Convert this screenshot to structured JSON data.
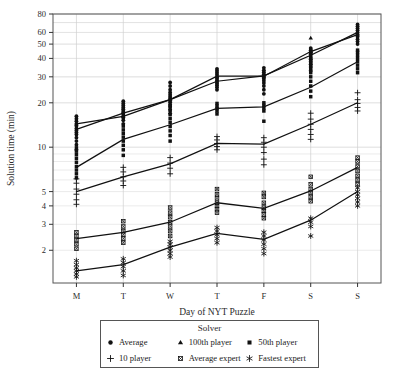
{
  "chart_data": {
    "type": "line",
    "title": "",
    "xlabel": "Day of NYT Puzzle",
    "ylabel": "Solution time (min)",
    "categories": [
      "M",
      "T",
      "W",
      "T",
      "F",
      "S",
      "S"
    ],
    "yscale": "log",
    "ylim": [
      1.2,
      80
    ],
    "yticks": [
      2,
      3,
      4,
      5,
      10,
      20,
      30,
      40,
      50,
      60,
      80
    ],
    "ytick_labels": [
      "2",
      "3",
      "4",
      "5",
      "10",
      "20",
      "30",
      "40",
      "50",
      "60",
      "80"
    ],
    "grid": true,
    "legend_position": "below",
    "legend_title": "Solver",
    "series": [
      {
        "name": "Average",
        "marker": "circle",
        "values": [
          13.2,
          17.0,
          21.0,
          28.0,
          30.5,
          42.0,
          60.0
        ],
        "scatter": [
          [
            9.6,
            10.4,
            11.0,
            11.6,
            12.2,
            12.6,
            13.0,
            13.4,
            13.9,
            14.4,
            15.0,
            15.6,
            16.2
          ],
          [
            14.4,
            15.2,
            15.8,
            16.3,
            16.8,
            17.2,
            17.6,
            18.1,
            18.6,
            19.2,
            19.8,
            20.5
          ],
          [
            17.0,
            18.0,
            18.8,
            19.5,
            20.2,
            20.8,
            21.4,
            22.0,
            22.7,
            23.5,
            24.5,
            26.0,
            27.5
          ],
          [
            24.5,
            25.5,
            26.3,
            27.0,
            27.7,
            28.4,
            29.2,
            30.0,
            31.0,
            32.0,
            33.0,
            34.0
          ],
          [
            23.0,
            24.5,
            26.0,
            27.2,
            28.2,
            29.2,
            30.2,
            31.2,
            32.2,
            33.2,
            34.5
          ],
          [
            33.0,
            35.0,
            36.5,
            38.0,
            39.5,
            41.0,
            42.5,
            44.0,
            45.5,
            47.0
          ],
          [
            50.0,
            52.0,
            54.0,
            56.0,
            58.0,
            60.0,
            62.0,
            64.0,
            66.0,
            68.0
          ]
        ]
      },
      {
        "name": "100th player",
        "marker": "triangle",
        "values": [
          14.4,
          16.2,
          21.0,
          30.3,
          30.3,
          44.5,
          58.0
        ],
        "scatter": [
          [
            14.4
          ],
          [
            16.2
          ],
          [
            21.0
          ],
          [
            30.3
          ],
          [
            30.3
          ],
          [
            44.5,
            55.0
          ],
          [
            58.0
          ]
        ]
      },
      {
        "name": "50th player",
        "marker": "square",
        "values": [
          7.3,
          11.3,
          14.2,
          18.3,
          18.8,
          25.5,
          38.0
        ],
        "scatter": [
          [
            6.2,
            6.6,
            7.0,
            7.4,
            7.9,
            8.4,
            8.9,
            9.4,
            9.9
          ],
          [
            8.8,
            9.6,
            10.3,
            11.0,
            11.7,
            12.4,
            13.1,
            13.9
          ],
          [
            11.0,
            12.0,
            12.9,
            13.8,
            14.7,
            15.6,
            16.6,
            17.8,
            19.0
          ],
          [
            16.8,
            17.6,
            18.3,
            19.0,
            19.8
          ],
          [
            15.0,
            17.6,
            18.4,
            19.2,
            20.0
          ],
          [
            22.0,
            24.0,
            26.0,
            28.0,
            30.0,
            32.0,
            34.0,
            36.0,
            38.0,
            40.0,
            43.0,
            45.5
          ],
          [
            32.0,
            34.0,
            36.0,
            38.0,
            40.0,
            42.0,
            44.0,
            45.5
          ]
        ]
      },
      {
        "name": "10 player",
        "marker": "plus",
        "values": [
          5.0,
          6.3,
          7.7,
          10.6,
          10.5,
          14.3,
          20.0
        ],
        "scatter": [
          [
            4.1,
            4.4,
            4.8,
            5.2,
            5.7,
            6.1
          ],
          [
            5.5,
            5.9,
            6.3,
            6.8,
            7.3
          ],
          [
            6.6,
            7.2,
            7.8,
            8.5
          ],
          [
            9.6,
            10.1,
            10.6,
            11.2,
            11.8
          ],
          [
            7.6,
            8.3,
            9.2,
            10.0,
            10.8,
            11.6
          ],
          [
            11.3,
            12.2,
            13.2,
            14.3,
            15.5,
            17.0
          ],
          [
            17.6,
            18.6,
            19.8,
            21.0,
            23.4
          ]
        ]
      },
      {
        "name": "Average expert",
        "marker": "crossed-square",
        "values": [
          2.4,
          2.65,
          3.1,
          4.2,
          3.85,
          5.05,
          7.3
        ],
        "scatter": [
          [
            2.05,
            2.2,
            2.35,
            2.5,
            2.65
          ],
          [
            2.25,
            2.4,
            2.55,
            2.7,
            2.9,
            3.15
          ],
          [
            2.5,
            2.7,
            2.9,
            3.1,
            3.35,
            3.6,
            3.9
          ],
          [
            3.6,
            3.8,
            4.0,
            4.2,
            4.5,
            4.8,
            5.2
          ],
          [
            3.3,
            3.5,
            3.7,
            3.9,
            4.2,
            4.6,
            4.9
          ],
          [
            4.3,
            4.6,
            4.9,
            5.2,
            5.6,
            6.3
          ],
          [
            5.6,
            6.0,
            6.4,
            6.9,
            7.4,
            8.0,
            8.5
          ]
        ]
      },
      {
        "name": "Fastest expert",
        "marker": "asterisk",
        "values": [
          1.45,
          1.6,
          2.1,
          2.6,
          2.37,
          3.2,
          5.0
        ],
        "scatter": [
          [
            1.32,
            1.38,
            1.45,
            1.52,
            1.6,
            1.7
          ],
          [
            1.35,
            1.45,
            1.55,
            1.65,
            1.75
          ],
          [
            1.8,
            1.9,
            2.0,
            2.1,
            2.2,
            2.3
          ],
          [
            2.25,
            2.4,
            2.55,
            2.7,
            2.85
          ],
          [
            1.9,
            2.05,
            2.2,
            2.35,
            2.5,
            2.65
          ],
          [
            2.5,
            2.9,
            3.1,
            3.3
          ],
          [
            4.0,
            4.25,
            4.5,
            4.75,
            5.0,
            5.3
          ]
        ]
      }
    ]
  },
  "legend": {
    "title": "Solver",
    "items": [
      {
        "label": "Average",
        "marker": "circle-icon"
      },
      {
        "label": "100th player",
        "marker": "triangle-icon"
      },
      {
        "label": "50th player",
        "marker": "square-icon"
      },
      {
        "label": "10 player",
        "marker": "plus-icon"
      },
      {
        "label": "Average expert",
        "marker": "crossed-square-icon"
      },
      {
        "label": "Fastest expert",
        "marker": "asterisk-icon"
      }
    ]
  },
  "colors": {
    "ink": "#111111",
    "grid": "#cccccc",
    "frame": "#555555",
    "background": "#ffffff"
  }
}
